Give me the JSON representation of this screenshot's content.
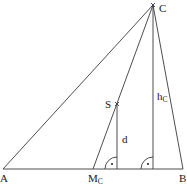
{
  "figure": {
    "width": 187,
    "height": 184,
    "line_color": "#3a3a3a",
    "text_color": "#1a1a1a",
    "background": "#ffffff"
  },
  "points": {
    "A": {
      "label": "A",
      "x": 3,
      "y": 169
    },
    "B": {
      "label": "B",
      "x": 183,
      "y": 169
    },
    "C": {
      "label": "C",
      "x": 153,
      "y": 5
    },
    "Mc": {
      "label": "M",
      "sub": "C",
      "x": 93,
      "y": 169
    },
    "S": {
      "label": "S",
      "x": 117,
      "y": 104
    }
  },
  "segments": {
    "d": {
      "label": "d"
    },
    "hc": {
      "label": "h",
      "sub": "C"
    }
  },
  "right_angle_markers": [
    {
      "at": "foot of d",
      "x": 117,
      "y": 169
    },
    {
      "at": "foot of hc",
      "x": 153,
      "y": 169
    }
  ]
}
